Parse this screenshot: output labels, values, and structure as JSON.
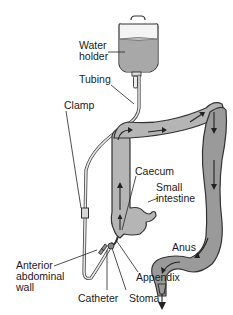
{
  "diagram": {
    "labels": {
      "water_holder_line1": "Water",
      "water_holder_line2": "holder",
      "tubing": "Tubing",
      "clamp": "Clamp",
      "caecum": "Caecum",
      "small_intestine_line1": "Small",
      "small_intestine_line2": "intestine",
      "anus": "Anus",
      "anterior_line1": "Anterior",
      "anterior_line2": "abdominal",
      "anterior_line3": "wall",
      "appendix": "Appendix",
      "catheter": "Catheter",
      "stoma": "Stoma"
    },
    "colors": {
      "water": "#a8a8a8",
      "colon_fill": "#b5b5b5",
      "outline": "#333333",
      "text": "#1a1a1a"
    }
  }
}
